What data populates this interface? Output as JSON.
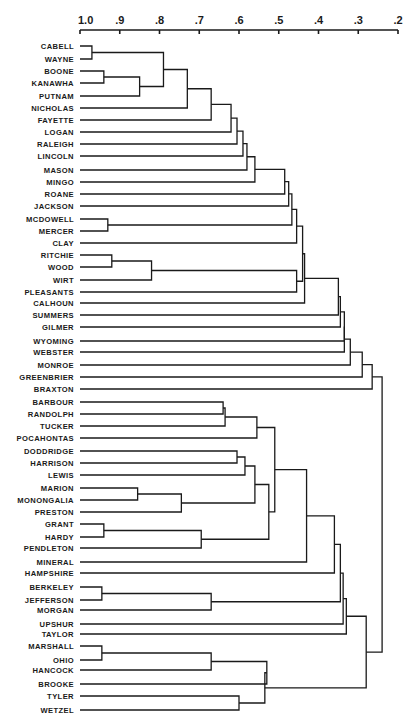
{
  "chart_data": {
    "type": "dendrogram",
    "title": "",
    "xlabel": "",
    "ylabel": "",
    "axis": {
      "position": "top",
      "range": [
        1.0,
        0.2
      ],
      "ticks": [
        {
          "label": "1.0",
          "value": 1.0
        },
        {
          "label": ".9",
          "value": 0.9
        },
        {
          "label": ".8",
          "value": 0.8
        },
        {
          "label": ".7",
          "value": 0.7
        },
        {
          "label": ".6",
          "value": 0.6
        },
        {
          "label": ".5",
          "value": 0.5
        },
        {
          "label": ".4",
          "value": 0.4
        },
        {
          "label": ".3",
          "value": 0.3
        },
        {
          "label": ".2",
          "value": 0.2
        }
      ]
    },
    "leaves": [
      {
        "label": "CABELL",
        "y": 46
      },
      {
        "label": "WAYNE",
        "y": 59
      },
      {
        "label": "BOONE",
        "y": 71
      },
      {
        "label": "KANAWHA",
        "y": 83
      },
      {
        "label": "PUTNAM",
        "y": 96
      },
      {
        "label": "NICHOLAS",
        "y": 108
      },
      {
        "label": "FAYETTE",
        "y": 120
      },
      {
        "label": "LOGAN",
        "y": 132
      },
      {
        "label": "RALEIGH",
        "y": 144
      },
      {
        "label": "LINCOLN",
        "y": 156
      },
      {
        "label": "MASON",
        "y": 170
      },
      {
        "label": "MINGO",
        "y": 182
      },
      {
        "label": "ROANE",
        "y": 194
      },
      {
        "label": "JACKSON",
        "y": 206
      },
      {
        "label": "MCDOWELL",
        "y": 219
      },
      {
        "label": "MERCER",
        "y": 231
      },
      {
        "label": "CLAY",
        "y": 243
      },
      {
        "label": "RITCHIE",
        "y": 255
      },
      {
        "label": "WOOD",
        "y": 267
      },
      {
        "label": "WIRT",
        "y": 280
      },
      {
        "label": "PLEASANTS",
        "y": 292
      },
      {
        "label": "CALHOUN",
        "y": 303
      },
      {
        "label": "SUMMERS",
        "y": 315
      },
      {
        "label": "GILMER",
        "y": 327
      },
      {
        "label": "WYOMING",
        "y": 341
      },
      {
        "label": "WEBSTER",
        "y": 352
      },
      {
        "label": "MONROE",
        "y": 365
      },
      {
        "label": "GREENBRIER",
        "y": 377
      },
      {
        "label": "BRAXTON",
        "y": 389
      },
      {
        "label": "BARBOUR",
        "y": 402
      },
      {
        "label": "RANDOLPH",
        "y": 414
      },
      {
        "label": "TUCKER",
        "y": 426
      },
      {
        "label": "POCAHONTAS",
        "y": 438
      },
      {
        "label": "DODDRIDGE",
        "y": 451
      },
      {
        "label": "HARRISON",
        "y": 463
      },
      {
        "label": "LEWIS",
        "y": 475
      },
      {
        "label": "MARION",
        "y": 488
      },
      {
        "label": "MONONGALIA",
        "y": 500
      },
      {
        "label": "PRESTON",
        "y": 512
      },
      {
        "label": "GRANT",
        "y": 524
      },
      {
        "label": "HARDY",
        "y": 537
      },
      {
        "label": "PENDLETON",
        "y": 548
      },
      {
        "label": "MINERAL",
        "y": 562
      },
      {
        "label": "HAMPSHIRE",
        "y": 573
      },
      {
        "label": "BERKELEY",
        "y": 587
      },
      {
        "label": "JEFFERSON",
        "y": 600
      },
      {
        "label": "MORGAN",
        "y": 610
      },
      {
        "label": "UPSHUR",
        "y": 624
      },
      {
        "label": "TAYLOR",
        "y": 634
      },
      {
        "label": "MARSHALL",
        "y": 646
      },
      {
        "label": "OHIO",
        "y": 660
      },
      {
        "label": "HANCOCK",
        "y": 670
      },
      {
        "label": "BROOKE",
        "y": 684
      },
      {
        "label": "TYLER",
        "y": 696
      },
      {
        "label": "WETZEL",
        "y": 710
      }
    ],
    "merges": [
      {
        "id": "n1",
        "a": "CABELL",
        "b": "WAYNE",
        "height": 0.97
      },
      {
        "id": "n2",
        "a": "BOONE",
        "b": "KANAWHA",
        "height": 0.94
      },
      {
        "id": "n3",
        "a": "n2",
        "b": "PUTNAM",
        "height": 0.85
      },
      {
        "id": "n4",
        "a": "n1",
        "b": "n3",
        "height": 0.79
      },
      {
        "id": "n5",
        "a": "n4",
        "b": "NICHOLAS",
        "height": 0.73
      },
      {
        "id": "n6",
        "a": "n5",
        "b": "FAYETTE",
        "height": 0.67
      },
      {
        "id": "n7",
        "a": "n6",
        "b": "LOGAN",
        "height": 0.62
      },
      {
        "id": "n8",
        "a": "n7",
        "b": "RALEIGH",
        "height": 0.605
      },
      {
        "id": "n9",
        "a": "n8",
        "b": "LINCOLN",
        "height": 0.59
      },
      {
        "id": "n10",
        "a": "n9",
        "b": "MASON",
        "height": 0.58
      },
      {
        "id": "n11",
        "a": "n10",
        "b": "MINGO",
        "height": 0.56
      },
      {
        "id": "n12",
        "a": "n11",
        "b": "ROANE",
        "height": 0.485
      },
      {
        "id": "n13",
        "a": "n12",
        "b": "JACKSON",
        "height": 0.475
      },
      {
        "id": "n14",
        "a": "MCDOWELL",
        "b": "MERCER",
        "height": 0.93
      },
      {
        "id": "n15",
        "a": "n13",
        "b": "n14",
        "height": 0.467
      },
      {
        "id": "n16",
        "a": "n15",
        "b": "CLAY",
        "height": 0.455
      },
      {
        "id": "n17",
        "a": "RITCHIE",
        "b": "WOOD",
        "height": 0.92
      },
      {
        "id": "n18",
        "a": "n17",
        "b": "WIRT",
        "height": 0.82
      },
      {
        "id": "n19",
        "a": "n18",
        "b": "PLEASANTS",
        "height": 0.455
      },
      {
        "id": "n20",
        "a": "n16",
        "b": "n19",
        "height": 0.44
      },
      {
        "id": "n21",
        "a": "n20",
        "b": "CALHOUN",
        "height": 0.435
      },
      {
        "id": "n22",
        "a": "n21",
        "b": "SUMMERS",
        "height": 0.35
      },
      {
        "id": "n23",
        "a": "n22",
        "b": "GILMER",
        "height": 0.345
      },
      {
        "id": "n24",
        "a": "n23",
        "b": "WYOMING",
        "height": 0.335
      },
      {
        "id": "n25",
        "a": "n24",
        "b": "WEBSTER",
        "height": 0.335
      },
      {
        "id": "n26",
        "a": "n25",
        "b": "MONROE",
        "height": 0.32
      },
      {
        "id": "n27",
        "a": "n26",
        "b": "GREENBRIER",
        "height": 0.29
      },
      {
        "id": "n28",
        "a": "n27",
        "b": "BRAXTON",
        "height": 0.265
      },
      {
        "id": "n29",
        "a": "BARBOUR",
        "b": "RANDOLPH",
        "height": 0.64
      },
      {
        "id": "n30",
        "a": "n29",
        "b": "TUCKER",
        "height": 0.635
      },
      {
        "id": "n31",
        "a": "n30",
        "b": "POCAHONTAS",
        "height": 0.555
      },
      {
        "id": "n32",
        "a": "DODDRIDGE",
        "b": "HARRISON",
        "height": 0.605
      },
      {
        "id": "n33",
        "a": "n32",
        "b": "LEWIS",
        "height": 0.585
      },
      {
        "id": "n34",
        "a": "MARION",
        "b": "MONONGALIA",
        "height": 0.855
      },
      {
        "id": "n35",
        "a": "n34",
        "b": "PRESTON",
        "height": 0.745
      },
      {
        "id": "n36",
        "a": "n33",
        "b": "n35",
        "height": 0.56
      },
      {
        "id": "n37",
        "a": "GRANT",
        "b": "HARDY",
        "height": 0.94
      },
      {
        "id": "n38",
        "a": "n37",
        "b": "PENDLETON",
        "height": 0.695
      },
      {
        "id": "n39",
        "a": "n36",
        "b": "n38",
        "height": 0.525
      },
      {
        "id": "n40",
        "a": "n31",
        "b": "n39",
        "height": 0.51
      },
      {
        "id": "n41",
        "a": "n40",
        "b": "MINERAL",
        "height": 0.43
      },
      {
        "id": "n42",
        "a": "n41",
        "b": "HAMPSHIRE",
        "height": 0.36
      },
      {
        "id": "n43",
        "a": "BERKELEY",
        "b": "JEFFERSON",
        "height": 0.945
      },
      {
        "id": "n44",
        "a": "n43",
        "b": "MORGAN",
        "height": 0.67
      },
      {
        "id": "n45",
        "a": "n42",
        "b": "n44",
        "height": 0.345
      },
      {
        "id": "n46",
        "a": "n45",
        "b": "UPSHUR",
        "height": 0.338
      },
      {
        "id": "n47",
        "a": "n46",
        "b": "TAYLOR",
        "height": 0.33
      },
      {
        "id": "n48",
        "a": "MARSHALL",
        "b": "OHIO",
        "height": 0.945
      },
      {
        "id": "n49",
        "a": "n48",
        "b": "HANCOCK",
        "height": 0.67
      },
      {
        "id": "n50",
        "a": "n49",
        "b": "BROOKE",
        "height": 0.53
      },
      {
        "id": "n51",
        "a": "TYLER",
        "b": "WETZEL",
        "height": 0.6
      },
      {
        "id": "n52",
        "a": "n50",
        "b": "n51",
        "height": 0.535
      },
      {
        "id": "n53",
        "a": "n47",
        "b": "n52",
        "height": 0.28
      },
      {
        "id": "n54",
        "a": "n28",
        "b": "n53",
        "height": 0.24
      }
    ]
  }
}
